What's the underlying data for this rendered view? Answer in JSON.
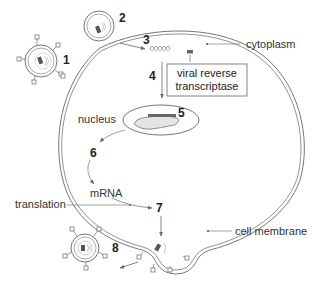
{
  "diagram": {
    "labels": {
      "cytoplasm": "cytoplasm",
      "nucleus": "nucleus",
      "enzyme_line1": "viral reverse",
      "enzyme_line2": "transcriptase",
      "mrna": "mRNA",
      "translation": "translation",
      "cell_membrane": "cell membrane"
    },
    "steps": [
      {
        "id": 1,
        "label": "1",
        "description": "virus particle attaches to cell membrane"
      },
      {
        "id": 2,
        "label": "2",
        "description": "virus enters cell by fusion"
      },
      {
        "id": 3,
        "label": "3",
        "description": "viral RNA released"
      },
      {
        "id": 4,
        "label": "4",
        "description": "reverse transcription to DNA"
      },
      {
        "id": 5,
        "label": "5",
        "description": "viral DNA integrates into host DNA in nucleus"
      },
      {
        "id": 6,
        "label": "6",
        "description": "transcription to mRNA"
      },
      {
        "id": 7,
        "label": "7",
        "description": "translation and assembly at membrane"
      },
      {
        "id": 8,
        "label": "8",
        "description": "new virus particle buds off"
      }
    ],
    "colors": {
      "line": "#555555",
      "membrane": "#777777",
      "fill_dark": "#555555",
      "fill_light": "#cccccc",
      "text": "#333333"
    }
  }
}
